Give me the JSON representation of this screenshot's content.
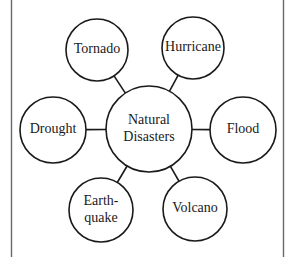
{
  "diagram": {
    "type": "concept-web",
    "frame": {
      "left_x": 11.5,
      "right_x": 283.5,
      "color": "#6a6a6a"
    },
    "center": {
      "id": "center",
      "lines": [
        "Natural",
        "Disasters"
      ],
      "cx": 149,
      "cy": 129,
      "r": 43
    },
    "nodes": [
      {
        "id": "tornado",
        "lines": [
          "Tornado"
        ],
        "cx": 97,
        "cy": 50,
        "r": 31
      },
      {
        "id": "hurricane",
        "lines": [
          "Hurricane"
        ],
        "cx": 193,
        "cy": 48,
        "r": 31
      },
      {
        "id": "drought",
        "lines": [
          "Drought"
        ],
        "cx": 53,
        "cy": 130,
        "r": 33
      },
      {
        "id": "flood",
        "lines": [
          "Flood"
        ],
        "cx": 243,
        "cy": 130,
        "r": 33
      },
      {
        "id": "earthquake",
        "lines": [
          "Earth-",
          "quake"
        ],
        "cx": 101,
        "cy": 210,
        "r": 32
      },
      {
        "id": "volcano",
        "lines": [
          "Volcano"
        ],
        "cx": 195,
        "cy": 209,
        "r": 32
      }
    ],
    "stroke_color": "#1a1a1a",
    "fill_color": "#ffffff"
  }
}
